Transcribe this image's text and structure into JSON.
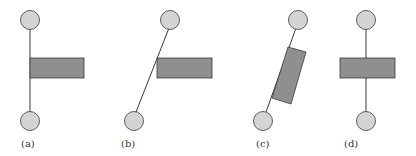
{
  "colors": {
    "background": "#ffffff",
    "circle_fill": "#d4d4d4",
    "block_fill": "#8f8f8f",
    "stroke": "#3a3a3a"
  },
  "panels": [
    {
      "id": "a",
      "label": "(a)",
      "description": "vertical rod, block attached to the side of the rod"
    },
    {
      "id": "b",
      "label": "(b)",
      "description": "tilted rod, block horizontal touching rod"
    },
    {
      "id": "c",
      "label": "(c)",
      "description": "tilted rod, block rotated to align with rod"
    },
    {
      "id": "d",
      "label": "(d)",
      "description": "vertical rod, block centered on rod"
    }
  ]
}
